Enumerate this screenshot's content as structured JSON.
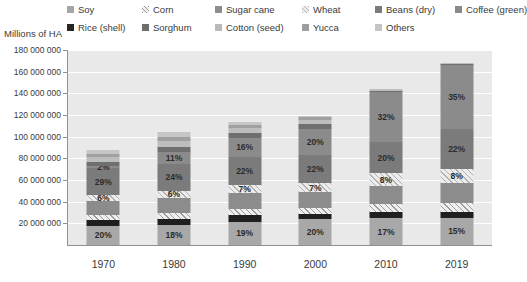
{
  "axis_title": "Millions of HA",
  "legend": {
    "row1": [
      {
        "label": "Soy",
        "icon": "legend-swatch-soy",
        "cls": "sw-soy",
        "x": 10
      },
      {
        "label": "Corn",
        "icon": "legend-swatch-corn",
        "cls": "sw-corn",
        "x": 85
      },
      {
        "label": "Sugar cane",
        "icon": "legend-swatch-sugar-cane",
        "cls": "sw-sugar",
        "x": 158
      },
      {
        "label": "Wheat",
        "icon": "legend-swatch-wheat",
        "cls": "sw-wheat",
        "x": 245
      },
      {
        "label": "Beans (dry)",
        "icon": "legend-swatch-beans",
        "cls": "sw-beans",
        "x": 318
      },
      {
        "label": "Coffee (green)",
        "icon": "legend-swatch-coffee",
        "cls": "sw-coffee",
        "x": 398
      }
    ],
    "row2": [
      {
        "label": "Rice (shell)",
        "icon": "legend-swatch-rice",
        "cls": "sw-rice",
        "x": 10
      },
      {
        "label": "Sorghum",
        "icon": "legend-swatch-sorghum",
        "cls": "sw-sorghum",
        "x": 85
      },
      {
        "label": "Cotton (seed)",
        "icon": "legend-swatch-cotton",
        "cls": "sw-cotton",
        "x": 158
      },
      {
        "label": "Yucca",
        "icon": "legend-swatch-yucca",
        "cls": "sw-yucca",
        "x": 245
      },
      {
        "label": "Others",
        "icon": "legend-swatch-others",
        "cls": "sw-others",
        "x": 318
      }
    ]
  },
  "chart_data": {
    "type": "bar",
    "subtype": "stacked-bar",
    "title": "",
    "xlabel": "",
    "ylabel": "Millions of HA",
    "ylim": [
      0,
      180000000
    ],
    "ytick_step": 20000000,
    "ytick_labels": [
      "180 000 000",
      "160 000 000",
      "140 000 000",
      "120 000 000",
      "100 000 000",
      "80 000 000",
      "60 000 000",
      "40 000 000",
      "20 000 000"
    ],
    "grid": true,
    "legend_position": "top",
    "categories": [
      "1970",
      "1980",
      "1990",
      "2000",
      "2010",
      "2019"
    ],
    "totals": [
      88000000,
      104000000,
      114000000,
      119000000,
      144000000,
      168000000
    ],
    "series": [
      {
        "name": "Soy",
        "cls": "t-soy",
        "values": [
          17600000,
          18720000,
          21660000,
          23800000,
          24480000,
          25200000
        ],
        "labels": [
          "20%",
          "18%",
          "19%",
          "20%",
          "17%",
          "15%"
        ]
      },
      {
        "name": "Rice (shell)",
        "cls": "t-rice",
        "values": [
          5280000,
          5200000,
          5700000,
          4760000,
          5760000,
          5040000
        ],
        "labels": [
          "",
          "",
          "",
          "",
          "",
          ""
        ]
      },
      {
        "name": "Corn",
        "cls": "t-corn",
        "values": [
          4400000,
          5200000,
          5700000,
          5950000,
          7200000,
          8400000
        ],
        "labels": [
          "",
          "",
          "",
          "",
          "",
          ""
        ]
      },
      {
        "name": "Sugar cane",
        "cls": "t-sugar",
        "values": [
          13200000,
          14560000,
          14820000,
          14280000,
          17280000,
          18480000
        ],
        "labels": [
          "",
          "",
          "",
          "",
          "",
          ""
        ]
      },
      {
        "name": "Wheat",
        "cls": "t-wheat",
        "values": [
          5280000,
          6240000,
          7980000,
          8330000,
          11520000,
          13440000
        ],
        "labels": [
          "6%",
          "6%",
          "7%",
          "7%",
          "8%",
          "8%"
        ]
      },
      {
        "name": "Beans (dry)",
        "cls": "t-beans",
        "values": [
          25520000,
          24960000,
          25080000,
          26180000,
          28800000,
          36960000
        ],
        "labels": [
          "29%",
          "24%",
          "22%",
          "22%",
          "20%",
          "22%"
        ]
      },
      {
        "name": "Coffee (green)",
        "cls": "t-coffee",
        "values": [
          1760000,
          11440000,
          18240000,
          23800000,
          46080000,
          58800000
        ],
        "labels": [
          "2%",
          "11%",
          "16%",
          "20%",
          "32%",
          "35%"
        ]
      },
      {
        "name": "Sorghum",
        "cls": "t-sorghum",
        "values": [
          3520000,
          4160000,
          4560000,
          4760000,
          1440000,
          840000
        ],
        "labels": [
          "",
          "",
          "",
          "",
          "",
          ""
        ]
      },
      {
        "name": "Cotton (seed)",
        "cls": "t-cotton",
        "values": [
          4400000,
          5200000,
          4560000,
          3570000,
          1440000,
          840000
        ],
        "labels": [
          "",
          "",
          "",
          "",
          "",
          ""
        ]
      },
      {
        "name": "Yucca",
        "cls": "t-yucca",
        "values": [
          3520000,
          4160000,
          2850000,
          2380000,
          0,
          0
        ],
        "labels": [
          "",
          "",
          "",
          "",
          "",
          ""
        ]
      },
      {
        "name": "Others",
        "cls": "t-others",
        "values": [
          3520000,
          4160000,
          2850000,
          1190000,
          0,
          0
        ],
        "labels": [
          "",
          "",
          "",
          "",
          "",
          ""
        ]
      }
    ]
  }
}
